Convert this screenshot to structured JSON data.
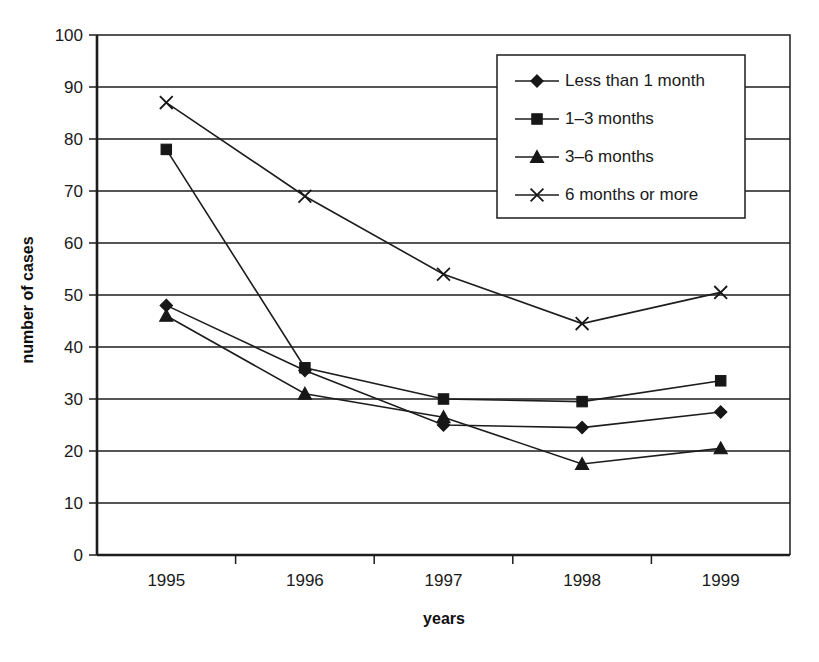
{
  "chart_data": {
    "type": "line",
    "title": "",
    "xlabel": "years",
    "ylabel": "number of cases",
    "categories": [
      "1995",
      "1996",
      "1997",
      "1998",
      "1999"
    ],
    "ylim": [
      0,
      100
    ],
    "yticks": [
      0,
      10,
      20,
      30,
      40,
      50,
      60,
      70,
      80,
      90,
      100
    ],
    "ytick_labels": [
      "0",
      "10",
      "20",
      "30",
      "40",
      "50",
      "60",
      "70",
      "80",
      "90",
      "100"
    ],
    "grid": true,
    "legend_position": "upper right",
    "series": [
      {
        "name": "Less than 1 month",
        "marker": "diamond",
        "values": [
          48,
          35.5,
          25,
          24.5,
          27.5
        ]
      },
      {
        "name": "1–3 months",
        "marker": "square",
        "values": [
          78,
          36,
          30,
          29.5,
          33.5
        ]
      },
      {
        "name": "3–6 months",
        "marker": "triangle",
        "values": [
          46,
          31,
          26.5,
          17.5,
          20.5
        ]
      },
      {
        "name": "6 months or more",
        "marker": "cross",
        "values": [
          87,
          69,
          54,
          44.5,
          50.5
        ]
      }
    ]
  },
  "legend": {
    "entries": [
      {
        "label": "Less than 1 month"
      },
      {
        "label": "1–3 months"
      },
      {
        "label": "3–6 months"
      },
      {
        "label": "6 months or more"
      }
    ]
  },
  "caption": {
    "text": ""
  }
}
